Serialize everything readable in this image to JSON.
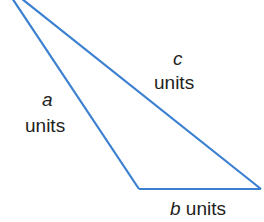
{
  "diagram": {
    "type": "triangle",
    "stroke_color": "#3a7fd0",
    "text_color": "#222222",
    "sides": [
      {
        "id": "a",
        "variable": "a",
        "unit": "units"
      },
      {
        "id": "b",
        "variable": "b",
        "unit": "units"
      },
      {
        "id": "c",
        "variable": "c",
        "unit": "units"
      }
    ]
  }
}
